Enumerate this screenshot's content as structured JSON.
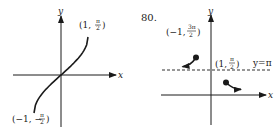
{
  "problem_number": "80.",
  "chart_data": [
    {
      "type": "line",
      "title": "",
      "xlabel": "x",
      "ylabel": "y",
      "series": [
        {
          "name": "arcsin-like curve",
          "points": [
            [
              -1,
              -1.5708
            ],
            [
              -0.5,
              -0.5236
            ],
            [
              0,
              0
            ],
            [
              0.5,
              0.5236
            ],
            [
              1,
              1.5708
            ]
          ],
          "endpoints": "closed-no-marker"
        }
      ],
      "annotations": [
        {
          "text_prefix": "(1, ",
          "num": "π",
          "den": "2",
          "text_suffix": ")",
          "at": [
            1,
            1.5708
          ]
        },
        {
          "text_prefix": "(−1, −",
          "num": "π",
          "den": "2",
          "text_suffix": ")",
          "at": [
            -1,
            -1.5708
          ]
        }
      ],
      "xlim": [
        -1.8,
        2.0
      ],
      "ylim": [
        -1.8,
        2.2
      ],
      "grid": false
    },
    {
      "type": "line",
      "title": "",
      "xlabel": "x",
      "ylabel": "y",
      "series": [
        {
          "name": "left branch",
          "points": [
            [
              -1,
              4.712
            ],
            [
              -1.4,
              3.9
            ],
            [
              -1.9,
              3.55
            ]
          ],
          "start_marker": "filled-dot",
          "end": "arrow"
        },
        {
          "name": "right branch",
          "points": [
            [
              1,
              1.5708
            ],
            [
              1.5,
              0.9
            ],
            [
              2.0,
              0.7
            ]
          ],
          "start_marker": "filled-dot",
          "end": "arrow"
        }
      ],
      "asymptote": {
        "y": 3.1416,
        "style": "dashed",
        "label": "y=π"
      },
      "annotations": [
        {
          "text_prefix": "(−1, ",
          "num": "3π",
          "den": "2",
          "text_suffix": ")",
          "at": [
            -1,
            4.712
          ]
        },
        {
          "text_prefix": "(1, ",
          "num": "π",
          "den": "2",
          "text_suffix": ")",
          "at": [
            1,
            1.5708
          ]
        }
      ],
      "grid": false
    }
  ]
}
